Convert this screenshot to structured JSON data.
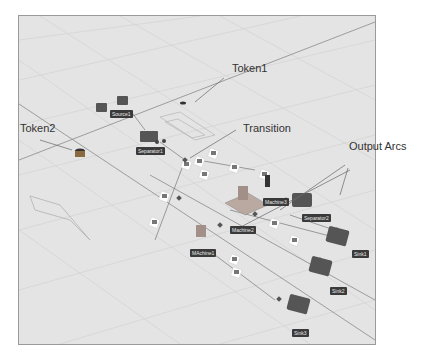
{
  "annotations": {
    "token1": "Token1",
    "token2": "Token2",
    "transition": "Transition",
    "output_arcs": "Output Arcs"
  },
  "nodes": {
    "source1": "Source1",
    "separator1": "Separator1",
    "machine1": "MAchine1",
    "machine2": "Machine2",
    "machine3": "Machine3",
    "separator2": "Separator2",
    "sink1": "Sink1",
    "sink2": "Sink2",
    "sink3": "Sink3"
  },
  "colors": {
    "floor": "#e4e4e4",
    "grid": "#cfcfcf",
    "label_bg": "#3a3a3a",
    "object": "#555555",
    "arc": "#777777"
  }
}
